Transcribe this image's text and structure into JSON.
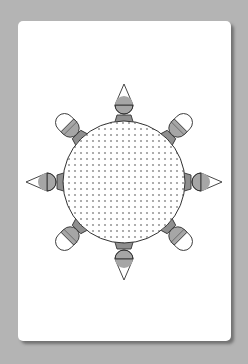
{
  "diagram": {
    "type": "round-table-seating",
    "table": {
      "shape": "circle",
      "fill_pattern": "dotted",
      "center": [
        124,
        182
      ],
      "radius": 61
    },
    "seat_count": 8,
    "seats": [
      {
        "position": "top",
        "angle": -90,
        "tip": "triangle"
      },
      {
        "position": "top-right",
        "angle": -45,
        "tip": "rounded"
      },
      {
        "position": "right",
        "angle": 0,
        "tip": "triangle"
      },
      {
        "position": "bottom-right",
        "angle": 45,
        "tip": "rounded"
      },
      {
        "position": "bottom",
        "angle": 90,
        "tip": "triangle"
      },
      {
        "position": "bottom-left",
        "angle": 135,
        "tip": "rounded"
      },
      {
        "position": "left",
        "angle": 180,
        "tip": "triangle"
      },
      {
        "position": "top-left",
        "angle": -135,
        "tip": "rounded"
      }
    ],
    "colors": {
      "background": "#b4b4b4",
      "card": "#ffffff",
      "chair_fill": "#a6a6a6",
      "chair_back": "#8f8f8f",
      "outline": "#333333",
      "dot": "#9a9a9a"
    }
  }
}
